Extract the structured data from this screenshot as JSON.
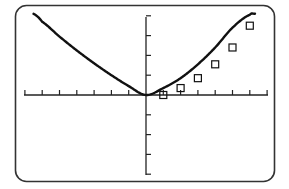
{
  "chart_data": {
    "type": "line",
    "title": "",
    "xlabel": "",
    "ylabel": "",
    "xlim": [
      -7,
      7
    ],
    "ylim": [
      -4,
      4
    ],
    "x_tick_step": 1,
    "y_tick_step": 1,
    "grid": false,
    "legend": null,
    "series": [
      {
        "name": "curve",
        "style": "line",
        "x": [
          -6.5,
          -6,
          -5,
          -4,
          -3,
          -2,
          -1,
          0,
          1,
          2,
          3,
          4,
          5,
          6,
          6.3
        ],
        "y": [
          4.1,
          3.7,
          2.95,
          2.25,
          1.6,
          1.0,
          0.45,
          0.0,
          0.35,
          0.85,
          1.55,
          2.4,
          3.4,
          4.05,
          4.1
        ]
      },
      {
        "name": "data points",
        "style": "marker",
        "marker": "square",
        "x": [
          1,
          2,
          3,
          4,
          5,
          6
        ],
        "y": [
          0.0,
          0.35,
          0.85,
          1.55,
          2.4,
          3.5
        ]
      }
    ]
  },
  "colors": {
    "background": "#ffffff",
    "frame": "#333333",
    "axes": "#222222",
    "curve": "#111111"
  }
}
